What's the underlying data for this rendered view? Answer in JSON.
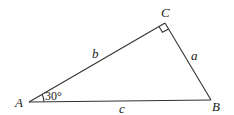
{
  "diagram": {
    "type": "right-triangle",
    "vertices": {
      "A": {
        "label": "A",
        "x": 29,
        "y": 102
      },
      "B": {
        "label": "B",
        "x": 211,
        "y": 100
      },
      "C": {
        "label": "C",
        "x": 165,
        "y": 23
      }
    },
    "sides": {
      "a": {
        "label": "a",
        "between": "B-C"
      },
      "b": {
        "label": "b",
        "between": "A-C"
      },
      "c": {
        "label": "c",
        "between": "A-B"
      }
    },
    "angle_A": {
      "label": "30°",
      "value_degrees": 30
    },
    "right_angle_at": "C",
    "colors": {
      "stroke": "#333333",
      "text": "#222222",
      "background": "#ffffff"
    }
  }
}
